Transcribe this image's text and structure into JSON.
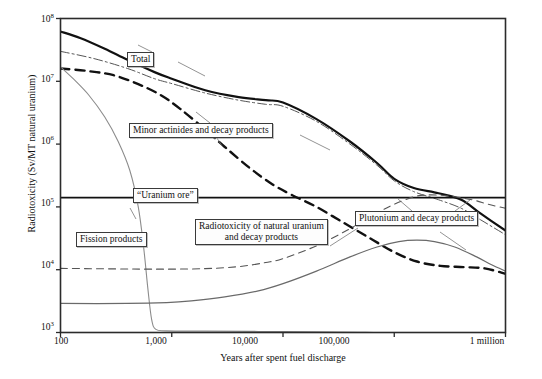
{
  "chart_data": {
    "type": "line",
    "title": "",
    "xlabel": "Years after spent fuel discharge",
    "ylabel": "Radiotoxicity (Sv/MT natural uranium)",
    "xscale": "log",
    "yscale": "log",
    "xlim": [
      100,
      1000000
    ],
    "ylim": [
      1000,
      100000000
    ],
    "grid": false,
    "legend_position": "inline-annotations",
    "xticks": [
      "100",
      "1,000",
      "10,000",
      "100,000",
      "1 million"
    ],
    "xtick_values": [
      100,
      1000,
      10000,
      100000,
      1000000
    ],
    "yticks": [
      "10^3",
      "10^4",
      "10^5",
      "10^6",
      "10^7",
      "10^8"
    ],
    "ytick_values": [
      1000,
      10000,
      100000,
      1000000,
      10000000,
      100000000
    ],
    "ytick_html": [
      "10<sup>3</sup>",
      "10<sup>4</sup>",
      "10<sup>5</sup>",
      "10<sup>6</sup>",
      "10<sup>7</sup>",
      "10<sup>8</sup>"
    ],
    "series": [
      {
        "name": "Total",
        "style": "solid-thick",
        "color": "#111111",
        "points": [
          [
            100,
            62000000
          ],
          [
            150,
            49000000
          ],
          [
            250,
            33000000
          ],
          [
            400,
            22000000
          ],
          [
            700,
            14000000
          ],
          [
            1000,
            11000000
          ],
          [
            2000,
            7200000
          ],
          [
            4000,
            5600000
          ],
          [
            7000,
            5000000
          ],
          [
            10000,
            4600000
          ],
          [
            20000,
            2500000
          ],
          [
            40000,
            1100000
          ],
          [
            70000,
            500000
          ],
          [
            100000,
            280000
          ],
          [
            150000,
            200000
          ],
          [
            250000,
            165000
          ],
          [
            400000,
            130000
          ],
          [
            600000,
            78000
          ],
          [
            1000000,
            42000
          ]
        ]
      },
      {
        "name": "Plutonium and decay products",
        "style": "dashdot-thin",
        "color": "#555555",
        "points": [
          [
            100,
            30000000
          ],
          [
            200,
            23000000
          ],
          [
            400,
            16000000
          ],
          [
            700,
            11000000
          ],
          [
            1000,
            9200000
          ],
          [
            2000,
            6500000
          ],
          [
            4000,
            5000000
          ],
          [
            7000,
            4300000
          ],
          [
            10000,
            4000000
          ],
          [
            20000,
            2300000
          ],
          [
            40000,
            1000000
          ],
          [
            70000,
            460000
          ],
          [
            100000,
            260000
          ],
          [
            150000,
            175000
          ],
          [
            250000,
            130000
          ],
          [
            400000,
            95000
          ],
          [
            600000,
            62000
          ],
          [
            1000000,
            36000
          ]
        ]
      },
      {
        "name": "Minor actinides and decay products",
        "style": "dashed-thick",
        "color": "#111111",
        "points": [
          [
            100,
            16000000
          ],
          [
            180,
            14500000
          ],
          [
            300,
            12500000
          ],
          [
            500,
            9000000
          ],
          [
            800,
            6000000
          ],
          [
            1200,
            3600000
          ],
          [
            2000,
            1700000
          ],
          [
            3000,
            900000
          ],
          [
            5000,
            420000
          ],
          [
            8000,
            230000
          ],
          [
            12000,
            155000
          ],
          [
            20000,
            100000
          ],
          [
            35000,
            56000
          ],
          [
            60000,
            32000
          ],
          [
            100000,
            19000
          ],
          [
            160000,
            13500
          ],
          [
            260000,
            11500
          ],
          [
            420000,
            11000
          ],
          [
            650000,
            10500
          ],
          [
            1000000,
            8600
          ]
        ]
      },
      {
        "name": "Fission products",
        "style": "solid-thin-gray",
        "color": "#8c8c8c",
        "points": [
          [
            100,
            17000000
          ],
          [
            130,
            11000000
          ],
          [
            180,
            6000000
          ],
          [
            250,
            2700000
          ],
          [
            330,
            1100000
          ],
          [
            420,
            380000
          ],
          [
            500,
            100000
          ],
          [
            560,
            22000
          ],
          [
            610,
            5000
          ],
          [
            660,
            1600
          ],
          [
            720,
            1120
          ],
          [
            900,
            1060
          ],
          [
            2000,
            1050
          ],
          [
            6000,
            1040
          ],
          [
            20000,
            1030
          ],
          [
            50000,
            1010
          ],
          [
            90000,
            980
          ],
          [
            130000,
            900
          ],
          [
            200000,
            820
          ],
          [
            300000,
            760
          ],
          [
            600000,
            730
          ],
          [
            1000000,
            720
          ]
        ]
      },
      {
        "name": "\"Uranium ore\"",
        "style": "solid-medium",
        "color": "#111111",
        "points": [
          [
            100,
            140000
          ],
          [
            1000000,
            140000
          ]
        ]
      },
      {
        "name": "Radiotoxicity of natural uranium and decay products",
        "style": "dashed-thin",
        "color": "#555555",
        "points": [
          [
            100,
            10500
          ],
          [
            300,
            10300
          ],
          [
            800,
            10200
          ],
          [
            2000,
            10400
          ],
          [
            4000,
            11200
          ],
          [
            7000,
            13000
          ],
          [
            10000,
            15000
          ],
          [
            20000,
            24000
          ],
          [
            40000,
            45000
          ],
          [
            70000,
            80000
          ],
          [
            100000,
            110000
          ],
          [
            150000,
            145000
          ],
          [
            200000,
            155000
          ],
          [
            300000,
            150000
          ],
          [
            500000,
            130000
          ],
          [
            700000,
            110000
          ],
          [
            1000000,
            95000
          ]
        ]
      },
      {
        "name": "Lower solid curve (uranium / residual actinides)",
        "style": "solid-thin-dark",
        "color": "#6a6a6a",
        "points": [
          [
            100,
            2900
          ],
          [
            400,
            2900
          ],
          [
            900,
            3000
          ],
          [
            1500,
            3200
          ],
          [
            3000,
            3700
          ],
          [
            6000,
            4600
          ],
          [
            10000,
            6000
          ],
          [
            20000,
            9500
          ],
          [
            40000,
            16000
          ],
          [
            70000,
            23000
          ],
          [
            110000,
            28000
          ],
          [
            160000,
            29500
          ],
          [
            230000,
            28000
          ],
          [
            350000,
            23000
          ],
          [
            550000,
            16000
          ],
          [
            750000,
            12000
          ],
          [
            1000000,
            9500
          ]
        ]
      }
    ],
    "annotations": [
      {
        "id": "total",
        "text": "Total"
      },
      {
        "id": "minor-actinides",
        "text": "Minor actinides and decay products"
      },
      {
        "id": "uranium-ore",
        "text": "\"Uranium ore\""
      },
      {
        "id": "fission-products",
        "text": "Fission products"
      },
      {
        "id": "natural-uranium",
        "line1": "Radiotoxicity of natural uranium",
        "line2": "and decay products"
      },
      {
        "id": "plutonium",
        "text": "Plutonium and decay products"
      }
    ]
  },
  "axes": {
    "ylabel": "Radiotoxicity (Sv/MT natural uranium)",
    "xlabel": "Years after spent fuel discharge",
    "x": {
      "t0": "100",
      "t1": "1,000",
      "t2": "10,000",
      "t3": "100,000",
      "t4": "1 million"
    },
    "y": {
      "t0": "10",
      "t1": "10",
      "t2": "10",
      "t3": "10",
      "t4": "10",
      "t5": "10",
      "e0": "3",
      "e1": "4",
      "e2": "5",
      "e3": "6",
      "e4": "7",
      "e5": "8"
    }
  },
  "labels": {
    "total": "Total",
    "minor_actinides": "Minor actinides and decay products",
    "uranium_ore": "“Uranium ore”",
    "fission_products": "Fission products",
    "natural_uranium_l1": "Radiotoxicity of natural uranium",
    "natural_uranium_l2": "and decay products",
    "plutonium": "Plutonium and decay products"
  },
  "colors": {
    "frame": "#2b2b2b",
    "total": "#111111",
    "plutonium": "#555555",
    "minor_actinides": "#111111",
    "fission_products": "#8c8c8c",
    "uranium_ore": "#111111",
    "natural_uranium": "#555555",
    "background": "#ffffff"
  }
}
